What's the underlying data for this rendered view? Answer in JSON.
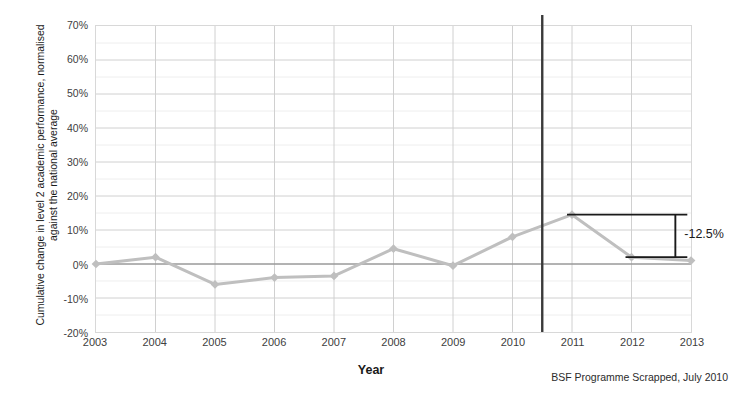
{
  "chart_data": {
    "type": "line",
    "title": "",
    "xlabel": "Year",
    "ylabel": "Cumulative change in level 2 academic performance, normalised against the national average",
    "categories": [
      "2003",
      "2004",
      "2005",
      "2006",
      "2007",
      "2008",
      "2009",
      "2010",
      "2011",
      "2012",
      "2013"
    ],
    "x": [
      2003,
      2004,
      2005,
      2006,
      2007,
      2008,
      2009,
      2010,
      2011,
      2012,
      2013
    ],
    "series": [
      {
        "name": "Cumulative change in level 2 academic performance",
        "values": [
          0,
          2,
          -6,
          -4,
          -3.5,
          4.5,
          -0.5,
          8,
          14.5,
          2,
          1
        ],
        "color": "#bfbfbf",
        "marker": "diamond"
      }
    ],
    "ylim": [
      -20,
      70
    ],
    "xlim": [
      2003,
      2013
    ],
    "ytick_labels": [
      "70%",
      "60%",
      "50%",
      "40%",
      "30%",
      "20%",
      "10%",
      "0%",
      "-10%",
      "-20%"
    ],
    "ytick_values": [
      70,
      60,
      50,
      40,
      30,
      20,
      10,
      0,
      -10,
      -20
    ],
    "yminor_values": [
      65,
      55,
      45,
      35,
      25,
      15,
      5,
      -5,
      -15
    ],
    "grid": true,
    "legend": "none",
    "zero_line": {
      "value": 0,
      "color": "#808080"
    },
    "event_line": {
      "label": "BSF Programme Scrapped, July 2010",
      "x": 2010.5,
      "color": "#3a3a3a"
    },
    "annotation": {
      "label": "-12.5%",
      "from_year": 2011,
      "from_value": 14.5,
      "to_year": 2012,
      "to_value": 2,
      "delta": -12.5,
      "color": "#1a1a1a"
    }
  },
  "axes": {
    "y_title": "Cumulative change in level 2 academic performance, normalised against the national average",
    "x_title": "Year"
  },
  "footer": {
    "caption": "BSF Programme Scrapped, July 2010"
  },
  "annotation": {
    "value_label": "-12.5%"
  },
  "colors": {
    "series": "#bfbfbf",
    "grid_major": "#d0d0d0",
    "grid_minor": "#eeeeee",
    "zero_line": "#7f7f7f",
    "event_line": "#3a3a3a",
    "text": "#333333",
    "plot_border": "#d8d8d8"
  }
}
